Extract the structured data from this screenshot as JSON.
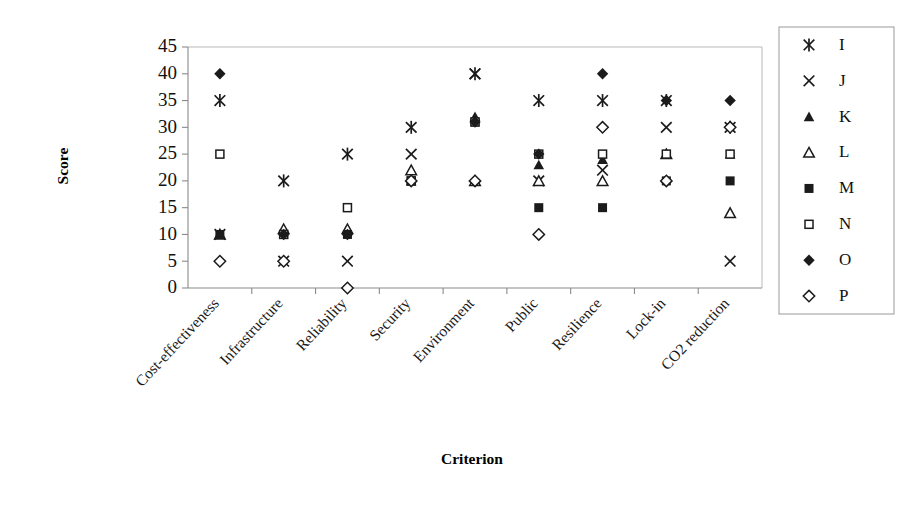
{
  "chart_data": {
    "type": "scatter",
    "title": "",
    "xlabel": "Criterion",
    "ylabel": "Score",
    "ylim": [
      0,
      45
    ],
    "yticks": [
      0,
      5,
      10,
      15,
      20,
      25,
      30,
      35,
      40,
      45
    ],
    "grid": false,
    "legend_position": "right",
    "categories": [
      "Cost-effectiveness",
      "Infrastructure",
      "Reliability",
      "Security",
      "Environment",
      "Public",
      "Resilience",
      "Lock-in",
      "CO2 reduction"
    ],
    "series": [
      {
        "name": "I",
        "marker": "asterisk",
        "values": [
          35,
          20,
          25,
          30,
          40,
          35,
          35,
          35,
          30
        ]
      },
      {
        "name": "J",
        "marker": "cross",
        "values": [
          10,
          5,
          5,
          25,
          40,
          20,
          22,
          30,
          5
        ]
      },
      {
        "name": "K",
        "marker": "triangle-filled",
        "values": [
          10,
          11,
          11,
          20,
          32,
          23,
          24,
          25,
          25
        ]
      },
      {
        "name": "L",
        "marker": "triangle-open",
        "values": [
          10,
          11,
          11,
          22,
          20,
          20,
          20,
          25,
          14
        ]
      },
      {
        "name": "M",
        "marker": "square-filled",
        "values": [
          10,
          10,
          10,
          20,
          31,
          15,
          15,
          20,
          20
        ]
      },
      {
        "name": "N",
        "marker": "square-open",
        "values": [
          25,
          10,
          15,
          20,
          31,
          25,
          25,
          25,
          25
        ]
      },
      {
        "name": "O",
        "marker": "diamond-filled",
        "values": [
          40,
          10,
          10,
          20,
          31,
          25,
          40,
          35,
          35
        ]
      },
      {
        "name": "P",
        "marker": "diamond-open",
        "values": [
          5,
          5,
          0,
          20,
          20,
          10,
          30,
          20,
          30
        ]
      }
    ]
  },
  "legend": {
    "entries": [
      {
        "label": "I",
        "marker": "asterisk"
      },
      {
        "label": "J",
        "marker": "cross"
      },
      {
        "label": "K",
        "marker": "triangle-filled"
      },
      {
        "label": "L",
        "marker": "triangle-open"
      },
      {
        "label": "M",
        "marker": "square-filled"
      },
      {
        "label": "N",
        "marker": "square-open"
      },
      {
        "label": "O",
        "marker": "diamond-filled"
      },
      {
        "label": "P",
        "marker": "diamond-open"
      }
    ]
  },
  "colors": {
    "marker": "#1b1b1b",
    "axis": "#8a8a8a",
    "plot_border": "#b9b9b9",
    "background": "#ffffff"
  }
}
